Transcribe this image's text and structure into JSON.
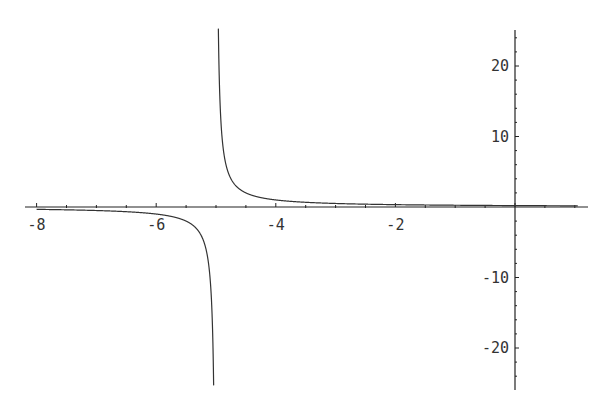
{
  "chart_data": {
    "type": "line",
    "title": "",
    "xlabel": "",
    "ylabel": "",
    "function": "1/(x+5)",
    "xlim": [
      -8.2,
      1.2
    ],
    "ylim": [
      -25.5,
      25.5
    ],
    "x_ticks": [
      -8,
      -6,
      -4,
      -2
    ],
    "x_tick_labels": [
      "-8",
      "-6",
      "-4",
      "-2"
    ],
    "y_ticks": [
      20,
      10,
      -10,
      -20
    ],
    "y_tick_labels": [
      "20",
      "10",
      "-10",
      "-20"
    ],
    "vertical_asymptote": -5,
    "grid": false,
    "legend": null,
    "series": [
      {
        "name": "left-branch",
        "x": [
          -8,
          -7,
          -6,
          -5.5,
          -5.2,
          -5.1,
          -5.04
        ],
        "y": [
          -0.333,
          -0.5,
          -1,
          -2,
          -5,
          -10,
          -25
        ]
      },
      {
        "name": "right-branch",
        "x": [
          -4.96,
          -4.9,
          -4.8,
          -4.5,
          -4,
          -3,
          -2,
          -1,
          0,
          1
        ],
        "y": [
          25,
          10,
          5,
          2,
          1,
          0.5,
          0.333,
          0.25,
          0.2,
          0.167
        ]
      }
    ]
  },
  "colors": {
    "axis": "#222222",
    "curve": "#333333",
    "background": "#ffffff"
  }
}
